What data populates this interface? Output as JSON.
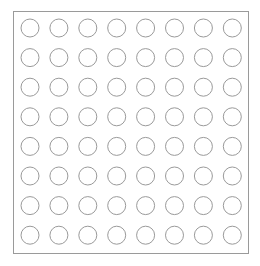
{
  "canvas": {
    "width": 260,
    "height": 266,
    "background_color": "#ffffff"
  },
  "frame": {
    "label": "grid-frame",
    "x": 13,
    "y": 11,
    "width": 235,
    "height": 242,
    "stroke_color": "#9a9a9a",
    "stroke_width": 1,
    "fill": "none"
  },
  "grid": {
    "label": "circle-grid",
    "rows": 8,
    "columns": 8,
    "total_circles": 64,
    "circle_radius": 9,
    "circle_diameter": 18,
    "column_pitch": 28.9,
    "row_pitch": 29.6,
    "first_center_x": 30,
    "first_center_y": 28,
    "inner_padding": 8,
    "circle_stroke_color": "#9a9a9a",
    "circle_stroke_width": 1,
    "circle_fill": "none"
  },
  "chart_data": {
    "type": "scatter",
    "title": "",
    "xlabel": "",
    "ylabel": "",
    "grid": false,
    "legend": "none",
    "xlim": [
      0,
      7
    ],
    "ylim": [
      0,
      7
    ],
    "marker": "open-circle",
    "marker_size": 18,
    "series": [
      {
        "name": "row-1",
        "x": [
          0,
          1,
          2,
          3,
          4,
          5,
          6,
          7
        ],
        "y": [
          0,
          0,
          0,
          0,
          0,
          0,
          0,
          0
        ]
      },
      {
        "name": "row-2",
        "x": [
          0,
          1,
          2,
          3,
          4,
          5,
          6,
          7
        ],
        "y": [
          1,
          1,
          1,
          1,
          1,
          1,
          1,
          1
        ]
      },
      {
        "name": "row-3",
        "x": [
          0,
          1,
          2,
          3,
          4,
          5,
          6,
          7
        ],
        "y": [
          2,
          2,
          2,
          2,
          2,
          2,
          2,
          2
        ]
      },
      {
        "name": "row-4",
        "x": [
          0,
          1,
          2,
          3,
          4,
          5,
          6,
          7
        ],
        "y": [
          3,
          3,
          3,
          3,
          3,
          3,
          3,
          3
        ]
      },
      {
        "name": "row-5",
        "x": [
          0,
          1,
          2,
          3,
          4,
          5,
          6,
          7
        ],
        "y": [
          4,
          4,
          4,
          4,
          4,
          4,
          4,
          4
        ]
      },
      {
        "name": "row-6",
        "x": [
          0,
          1,
          2,
          3,
          4,
          5,
          6,
          7
        ],
        "y": [
          5,
          5,
          5,
          5,
          5,
          5,
          5,
          5
        ]
      },
      {
        "name": "row-7",
        "x": [
          0,
          1,
          2,
          3,
          4,
          5,
          6,
          7
        ],
        "y": [
          6,
          6,
          6,
          6,
          6,
          6,
          6,
          6
        ]
      },
      {
        "name": "row-8",
        "x": [
          0,
          1,
          2,
          3,
          4,
          5,
          6,
          7
        ],
        "y": [
          7,
          7,
          7,
          7,
          7,
          7,
          7,
          7
        ]
      }
    ]
  }
}
